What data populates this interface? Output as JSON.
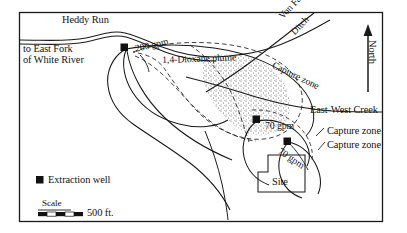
{
  "figure": {
    "type": "site-map",
    "background_color": "#ffffff",
    "line_color": "#1a1a1a",
    "stipple_color": "#555555"
  },
  "labels": {
    "heddy_run": "Heddy Run",
    "to_east_fork": "to East Fork",
    "of_white_river": "of White River",
    "flow_200": "200 gpm",
    "plume": "1,4-Dioxane plume",
    "von_fange": "Von Fange",
    "ditch": "Ditch",
    "capture_zone_top": "Capture zone",
    "north": "North",
    "east_west_creek": "East-West Creek",
    "flow_70_a": "70 gpm",
    "flow_70_b": "70 gpm",
    "capture_zone_1": "Capture zone",
    "capture_zone_2": "Capture zone",
    "site": "Site"
  },
  "legend": {
    "extraction_well": "Extraction well",
    "marker": "filled-square-marker"
  },
  "scale": {
    "title": "Scale",
    "distance": "500 ft.",
    "segments": 5
  },
  "wells": [
    {
      "name": "north-well",
      "rate": "200 gpm",
      "x": 124,
      "y": 47
    },
    {
      "name": "middle-well",
      "rate": "70 gpm",
      "x": 256,
      "y": 119
    },
    {
      "name": "south-well",
      "rate": "70 gpm",
      "x": 287,
      "y": 141
    }
  ],
  "compass": {
    "direction": "North",
    "points": "up"
  }
}
